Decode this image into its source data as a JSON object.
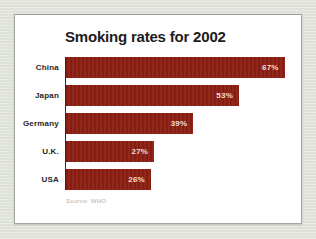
{
  "window": {
    "background_color": "#e2e5dc"
  },
  "card": {
    "background_color": "#ffffff",
    "border_color": "#a3a89f"
  },
  "chart_data": {
    "type": "bar",
    "orientation": "horizontal",
    "title": "Smoking rates for 2002",
    "categories": [
      "China",
      "Japan",
      "Germany",
      "U.K.",
      "USA"
    ],
    "values": [
      67,
      53,
      39,
      27,
      26
    ],
    "value_labels": [
      "67%",
      "53%",
      "39%",
      "27%",
      "26%"
    ],
    "xlim": [
      0,
      72
    ],
    "xlabel": "",
    "ylabel": "",
    "grid": false,
    "legend": false,
    "bar_color": "#8e2014",
    "value_label_color": "#f1dcd3",
    "axis_line_color": "#2b2b26",
    "title_color": "#1c1c1c",
    "source_note": "Source: WHO"
  }
}
